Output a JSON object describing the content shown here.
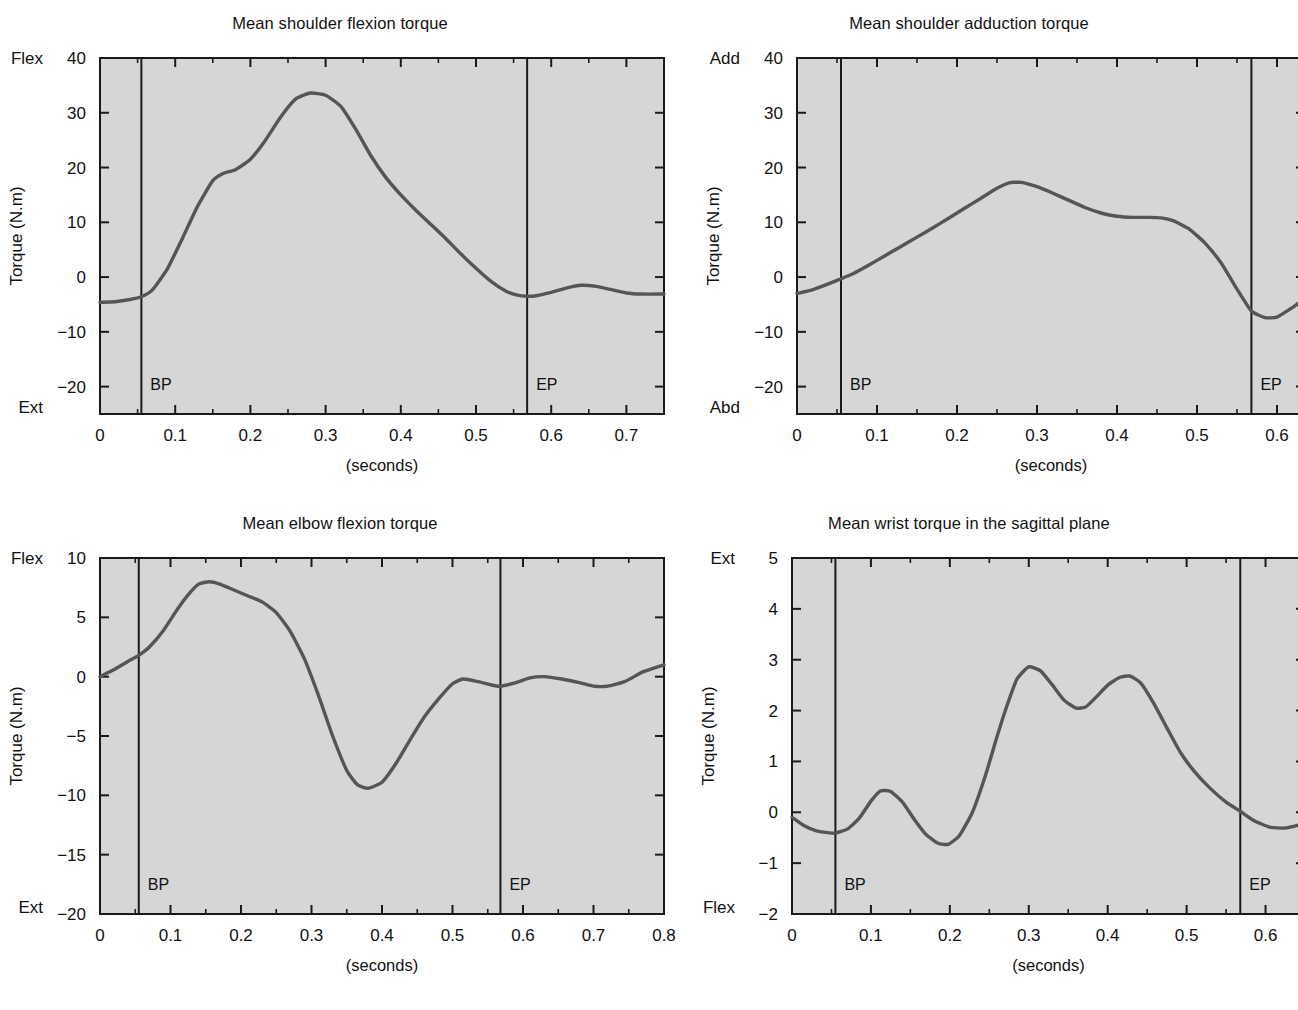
{
  "figure": {
    "background": "#ffffff",
    "plot_background": "#d6d6d6",
    "curve_color": "#555555",
    "axis_color": "#1a1a1a",
    "x_caption": "(seconds)"
  },
  "chart_data": [
    {
      "id": "shoulder-flexion",
      "type": "line",
      "title": "Mean shoulder flexion torque",
      "xlabel": "(seconds)",
      "ylabel": "Torque (N.m)",
      "xlim": [
        0,
        0.75
      ],
      "ylim": [
        -25,
        40
      ],
      "xticks": [
        0,
        0.1,
        0.2,
        0.3,
        0.4,
        0.5,
        0.6,
        0.7
      ],
      "xticklabels": [
        "0",
        "0.1",
        "0.2",
        "0.3",
        "0.4",
        "0.5",
        "0.6",
        "0.7"
      ],
      "xminor_step": 0.05,
      "yticks": [
        -20,
        -10,
        0,
        10,
        20,
        30,
        40
      ],
      "yticklabels": [
        "−20",
        "−10",
        "0",
        "10",
        "20",
        "30",
        "40"
      ],
      "y_top_label": "Flex",
      "y_bottom_label": "Ext",
      "y_top_label_at": 40,
      "grid": false,
      "events": [
        {
          "label": "BP",
          "x": 0.055
        },
        {
          "label": "EP",
          "x": 0.568
        }
      ],
      "x": [
        0.0,
        0.02,
        0.04,
        0.055,
        0.07,
        0.09,
        0.11,
        0.13,
        0.15,
        0.165,
        0.18,
        0.2,
        0.22,
        0.24,
        0.26,
        0.28,
        0.3,
        0.32,
        0.34,
        0.36,
        0.38,
        0.4,
        0.42,
        0.44,
        0.46,
        0.48,
        0.5,
        0.52,
        0.54,
        0.555,
        0.568,
        0.58,
        0.6,
        0.62,
        0.64,
        0.66,
        0.68,
        0.7,
        0.72,
        0.75
      ],
      "y": [
        -4.6,
        -4.5,
        -4.1,
        -3.6,
        -2.3,
        1.6,
        7.2,
        13.0,
        17.6,
        19.0,
        19.6,
        21.5,
        25.0,
        29.2,
        32.5,
        33.6,
        33.2,
        31.2,
        27.0,
        22.2,
        18.2,
        15.0,
        12.2,
        9.6,
        7.0,
        4.2,
        1.6,
        -0.8,
        -2.6,
        -3.3,
        -3.5,
        -3.4,
        -2.8,
        -2.0,
        -1.5,
        -1.7,
        -2.3,
        -2.9,
        -3.1,
        -3.1
      ]
    },
    {
      "id": "shoulder-adduction",
      "type": "line",
      "title": "Mean shoulder adduction torque",
      "xlabel": "(seconds)",
      "ylabel": "Torque (N.m)",
      "xlim": [
        0,
        0.635
      ],
      "ylim": [
        -25,
        40
      ],
      "xticks": [
        0,
        0.1,
        0.2,
        0.3,
        0.4,
        0.5,
        0.6
      ],
      "xticklabels": [
        "0",
        "0.1",
        "0.2",
        "0.3",
        "0.4",
        "0.5",
        "0.6"
      ],
      "xminor_step": 0.05,
      "yticks": [
        -20,
        -10,
        0,
        10,
        20,
        30,
        40
      ],
      "yticklabels": [
        "−20",
        "−10",
        "0",
        "10",
        "20",
        "30",
        "40"
      ],
      "y_top_label": "Add",
      "y_bottom_label": "Abd",
      "y_top_label_at": 40,
      "grid": false,
      "events": [
        {
          "label": "BP",
          "x": 0.055
        },
        {
          "label": "EP",
          "x": 0.568
        }
      ],
      "x": [
        0.0,
        0.02,
        0.04,
        0.055,
        0.07,
        0.09,
        0.11,
        0.13,
        0.15,
        0.17,
        0.19,
        0.21,
        0.23,
        0.25,
        0.265,
        0.28,
        0.3,
        0.32,
        0.34,
        0.36,
        0.38,
        0.4,
        0.42,
        0.44,
        0.455,
        0.47,
        0.49,
        0.51,
        0.53,
        0.55,
        0.568,
        0.585,
        0.6,
        0.62,
        0.635
      ],
      "y": [
        -3.0,
        -2.3,
        -1.2,
        -0.3,
        0.6,
        2.2,
        3.9,
        5.6,
        7.3,
        9.0,
        10.8,
        12.6,
        14.4,
        16.2,
        17.2,
        17.3,
        16.5,
        15.3,
        14.0,
        12.7,
        11.7,
        11.1,
        10.9,
        10.9,
        10.8,
        10.3,
        8.8,
        6.2,
        2.6,
        -2.2,
        -6.2,
        -7.4,
        -7.3,
        -5.5,
        -3.9
      ]
    },
    {
      "id": "elbow-flexion",
      "type": "line",
      "title": "Mean elbow flexion torque",
      "xlabel": "(seconds)",
      "ylabel": "Torque (N.m)",
      "xlim": [
        0,
        0.8
      ],
      "ylim": [
        -20,
        10
      ],
      "xticks": [
        0,
        0.1,
        0.2,
        0.3,
        0.4,
        0.5,
        0.6,
        0.7,
        0.8
      ],
      "xticklabels": [
        "0",
        "0.1",
        "0.2",
        "0.3",
        "0.4",
        "0.5",
        "0.6",
        "0.7",
        "0.8"
      ],
      "xminor_step": 0.05,
      "yticks": [
        -20,
        -15,
        -10,
        -5,
        0,
        5,
        10
      ],
      "yticklabels": [
        "−20",
        "−15",
        "−10",
        "−5",
        "0",
        "5",
        "10"
      ],
      "y_top_label": "Flex",
      "y_bottom_label": "Ext",
      "y_top_label_at": 10,
      "grid": false,
      "events": [
        {
          "label": "BP",
          "x": 0.055
        },
        {
          "label": "EP",
          "x": 0.568
        }
      ],
      "x": [
        0.0,
        0.02,
        0.04,
        0.055,
        0.07,
        0.09,
        0.11,
        0.125,
        0.14,
        0.155,
        0.17,
        0.19,
        0.21,
        0.23,
        0.25,
        0.27,
        0.29,
        0.31,
        0.33,
        0.35,
        0.365,
        0.38,
        0.4,
        0.42,
        0.44,
        0.46,
        0.48,
        0.5,
        0.515,
        0.535,
        0.555,
        0.568,
        0.59,
        0.61,
        0.63,
        0.655,
        0.68,
        0.7,
        0.72,
        0.745,
        0.77,
        0.8
      ],
      "y": [
        0.0,
        0.6,
        1.3,
        1.8,
        2.5,
        3.9,
        5.7,
        6.9,
        7.8,
        8.0,
        7.8,
        7.3,
        6.8,
        6.3,
        5.4,
        3.8,
        1.5,
        -1.6,
        -5.0,
        -7.9,
        -9.1,
        -9.4,
        -8.9,
        -7.3,
        -5.3,
        -3.4,
        -1.9,
        -0.6,
        -0.2,
        -0.4,
        -0.7,
        -0.8,
        -0.5,
        -0.1,
        0.0,
        -0.2,
        -0.5,
        -0.8,
        -0.8,
        -0.4,
        0.4,
        1.0
      ]
    },
    {
      "id": "wrist-sagittal",
      "type": "line",
      "title": "Mean wrist torque in the sagittal plane",
      "xlabel": "(seconds)",
      "ylabel": "Torque (N.m)",
      "xlim": [
        0,
        0.65
      ],
      "ylim": [
        -2,
        5
      ],
      "xticks": [
        0,
        0.1,
        0.2,
        0.3,
        0.4,
        0.5,
        0.6
      ],
      "xticklabels": [
        "0",
        "0.1",
        "0.2",
        "0.3",
        "0.4",
        "0.5",
        "0.6"
      ],
      "xminor_step": 0.05,
      "yticks": [
        -2,
        -1,
        0,
        1,
        2,
        3,
        4,
        5
      ],
      "yticklabels": [
        "−2",
        "−1",
        "0",
        "1",
        "2",
        "3",
        "4",
        "5"
      ],
      "y_top_label": "Ext",
      "y_bottom_label": "Flex",
      "y_top_label_at": 5,
      "grid": false,
      "events": [
        {
          "label": "BP",
          "x": 0.055
        },
        {
          "label": "EP",
          "x": 0.568
        }
      ],
      "x": [
        0.0,
        0.015,
        0.03,
        0.045,
        0.055,
        0.07,
        0.085,
        0.1,
        0.112,
        0.125,
        0.14,
        0.155,
        0.17,
        0.185,
        0.198,
        0.212,
        0.228,
        0.245,
        0.26,
        0.272,
        0.285,
        0.3,
        0.315,
        0.33,
        0.345,
        0.36,
        0.372,
        0.385,
        0.4,
        0.415,
        0.428,
        0.442,
        0.458,
        0.475,
        0.492,
        0.51,
        0.53,
        0.55,
        0.568,
        0.585,
        0.605,
        0.625,
        0.65
      ],
      "y": [
        -0.1,
        -0.26,
        -0.36,
        -0.4,
        -0.41,
        -0.33,
        -0.12,
        0.22,
        0.42,
        0.41,
        0.2,
        -0.14,
        -0.44,
        -0.61,
        -0.63,
        -0.46,
        -0.02,
        0.72,
        1.5,
        2.08,
        2.62,
        2.86,
        2.78,
        2.5,
        2.2,
        2.05,
        2.07,
        2.26,
        2.5,
        2.65,
        2.68,
        2.54,
        2.15,
        1.66,
        1.18,
        0.8,
        0.47,
        0.2,
        0.02,
        -0.16,
        -0.29,
        -0.31,
        -0.22
      ]
    }
  ]
}
